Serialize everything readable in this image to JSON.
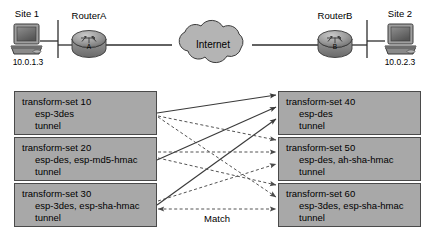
{
  "topology": {
    "site1": {
      "label": "Site 1",
      "ip": "10.0.1.3",
      "icon": "workstation-icon"
    },
    "routerA": {
      "label": "RouterA",
      "letter": "A",
      "icon": "router-icon"
    },
    "cloud": {
      "label": "Internet",
      "icon": "cloud-icon"
    },
    "routerB": {
      "label": "RouterB",
      "letter": "B",
      "icon": "router-icon"
    },
    "site2": {
      "label": "Site 2",
      "ip": "10.0.2.3",
      "icon": "workstation-icon"
    }
  },
  "left_transform_sets": [
    {
      "title": "transform-set 10",
      "transforms": "esp-3des",
      "mode": "tunnel"
    },
    {
      "title": "transform-set 20",
      "transforms": "esp-des, esp-md5-hmac",
      "mode": "tunnel"
    },
    {
      "title": "transform-set 30",
      "transforms": "esp-3des, esp-sha-hmac",
      "mode": "tunnel"
    }
  ],
  "right_transform_sets": [
    {
      "title": "transform-set 40",
      "transforms": "esp-des",
      "mode": "tunnel"
    },
    {
      "title": "transform-set 50",
      "transforms": "esp-des, ah-sha-hmac",
      "mode": "tunnel"
    },
    {
      "title": "transform-set 60",
      "transforms": "esp-3des, esp-sha-hmac",
      "mode": "tunnel"
    }
  ],
  "match_label": "Match",
  "colors": {
    "box_fill": "#a8a8a8",
    "box_stroke": "#4a4a4a",
    "cloud_fill": "#b4b4b4",
    "line": "#3a3a3a",
    "dashed_line": "#5a5a5a",
    "background": "#ffffff"
  }
}
